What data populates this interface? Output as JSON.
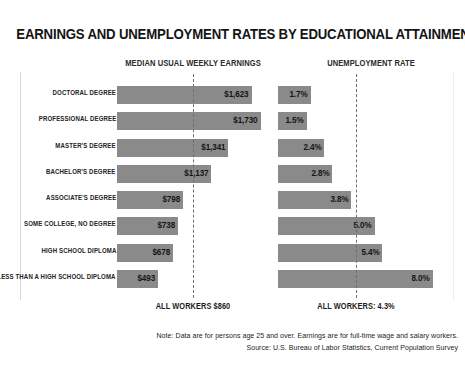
{
  "chart_title": "EARNINGS AND UNEMPLOYMENT RATES BY EDUCATIONAL ATTAINMENT, 2015",
  "columns": {
    "earnings_header": "MEDIAN USUAL WEEKLY EARNINGS",
    "unemployment_header": "UNEMPLOYMENT RATE"
  },
  "reference": {
    "earnings_label": "ALL WORKERS $860",
    "unemployment_label": "ALL WORKERS: 4.3%"
  },
  "notes": {
    "line1": "Note: Data are for persons age 25 and over. Earnings are for full-time wage and salary workers.",
    "line2": "Source: U.S. Bureau of Labor Statistics, Current Population Survey"
  },
  "colors": {
    "bar": "#8a8a8a",
    "background": "#ffffff",
    "text": "#141414",
    "refline": "#6f6f6f"
  },
  "chart_data": {
    "type": "bar",
    "title": "EARNINGS AND UNEMPLOYMENT RATES BY EDUCATIONAL ATTAINMENT, 2015",
    "orientation": "horizontal",
    "categories": [
      "DOCTORAL DEGREE",
      "PROFESSIONAL DEGREE",
      "MASTER'S DEGREE",
      "BACHELOR'S DEGREE",
      "ASSOCIATE'S DEGREE",
      "SOME COLLEGE, NO DEGREE",
      "HIGH SCHOOL DIPLOMA",
      "LESS THAN A HIGH SCHOOL DIPLOMA"
    ],
    "series": [
      {
        "name": "MEDIAN USUAL WEEKLY EARNINGS",
        "unit": "USD per week",
        "values": [
          1623,
          1730,
          1341,
          1137,
          798,
          738,
          678,
          493
        ],
        "labels": [
          "$1,623",
          "$1,730",
          "$1,341",
          "$1,137",
          "$798",
          "$738",
          "$678",
          "$493"
        ],
        "reference_value": 860,
        "reference_label": "ALL WORKERS $860",
        "xlim": [
          0,
          1830
        ]
      },
      {
        "name": "UNEMPLOYMENT RATE",
        "unit": "percent",
        "values": [
          1.7,
          1.5,
          2.4,
          2.8,
          3.8,
          5.0,
          5.4,
          8.0
        ],
        "labels": [
          "1.7%",
          "1.5%",
          "2.4%",
          "2.8%",
          "3.8%",
          "5.0%",
          "5.4%",
          "8.0%"
        ],
        "reference_value": 4.3,
        "reference_label": "ALL WORKERS: 4.3%",
        "xlim": [
          0,
          8.9
        ]
      }
    ],
    "xlabel": "",
    "ylabel": "",
    "grid": false,
    "legend": "none",
    "annotations": [
      "Note: Data are for persons age 25 and over. Earnings are for full-time wage and salary workers.",
      "Source: U.S. Bureau of Labor Statistics, Current Population Survey"
    ]
  }
}
